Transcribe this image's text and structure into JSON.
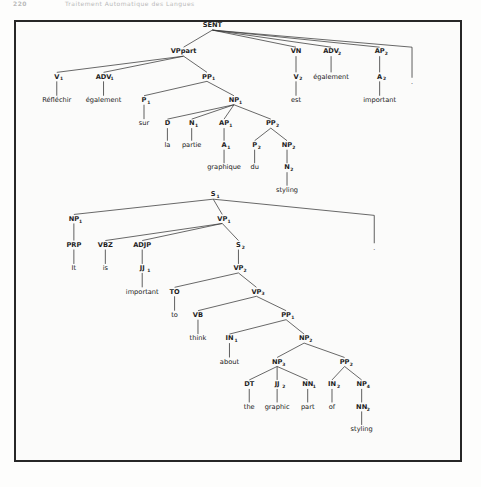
{
  "page": {
    "running_head": {
      "folio": "220",
      "title": "Traitement Automatique des Langues"
    },
    "frame": {
      "border_color": "#272727",
      "background": "#fbfbfa"
    }
  },
  "figure": {
    "trees": [
      {
        "id": "french-tree",
        "root": "SENT",
        "language": "French",
        "nodes": [
          {
            "name": "SENT",
            "label": "SENT",
            "sub": "",
            "x": 228,
            "y": 28,
            "type": "nonterminal"
          },
          {
            "name": "VPpart",
            "label": "VPpart",
            "sub": "",
            "x": 196,
            "y": 57,
            "type": "nonterminal"
          },
          {
            "name": "VN",
            "label": "VN",
            "sub": "",
            "x": 321,
            "y": 57,
            "type": "nonterminal"
          },
          {
            "name": "ADV2",
            "label": "ADV",
            "sub": "2",
            "x": 360,
            "y": 57,
            "type": "nonterminal"
          },
          {
            "name": "AP2",
            "label": "AP",
            "sub": "2",
            "x": 414,
            "y": 57,
            "type": "nonterminal"
          },
          {
            "name": "V1",
            "label": "V",
            "sub": "1",
            "x": 55,
            "y": 85,
            "type": "preterminal"
          },
          {
            "name": "ADV1",
            "label": "ADV",
            "sub": "1",
            "x": 107,
            "y": 85,
            "type": "preterminal"
          },
          {
            "name": "PP1",
            "label": "PP",
            "sub": "1",
            "x": 222,
            "y": 85,
            "type": "nonterminal"
          },
          {
            "name": "V2",
            "label": "V",
            "sub": "2",
            "x": 321,
            "y": 85,
            "type": "preterminal"
          },
          {
            "name": "egalement-adv2",
            "label": "également",
            "sub": "",
            "x": 360,
            "y": 85,
            "type": "leaf"
          },
          {
            "name": "A2",
            "label": "A",
            "sub": "2",
            "x": 414,
            "y": 85,
            "type": "preterminal"
          },
          {
            "name": "Reflechir",
            "label": "Réfléchir",
            "sub": "",
            "x": 55,
            "y": 111,
            "type": "leaf"
          },
          {
            "name": "egalement-adv1",
            "label": "également",
            "sub": "",
            "x": 107,
            "y": 111,
            "type": "leaf"
          },
          {
            "name": "P1",
            "label": "P",
            "sub": "1",
            "x": 152,
            "y": 111,
            "type": "preterminal"
          },
          {
            "name": "NP1",
            "label": "NP",
            "sub": "1",
            "x": 252,
            "y": 111,
            "type": "nonterminal"
          },
          {
            "name": "est",
            "label": "est",
            "sub": "",
            "x": 321,
            "y": 111,
            "type": "leaf"
          },
          {
            "name": "important-a2",
            "label": "important",
            "sub": "",
            "x": 414,
            "y": 111,
            "type": "leaf"
          },
          {
            "name": "sur",
            "label": "sur",
            "sub": "",
            "x": 152,
            "y": 137,
            "type": "leaf"
          },
          {
            "name": "D",
            "label": "D",
            "sub": "",
            "x": 178,
            "y": 137,
            "type": "preterminal"
          },
          {
            "name": "N1",
            "label": "N",
            "sub": "1",
            "x": 205,
            "y": 137,
            "type": "preterminal"
          },
          {
            "name": "AP1",
            "label": "AP",
            "sub": "1",
            "x": 241,
            "y": 137,
            "type": "nonterminal"
          },
          {
            "name": "PP2",
            "label": "PP",
            "sub": "2",
            "x": 293,
            "y": 137,
            "type": "nonterminal"
          },
          {
            "name": "la",
            "label": "la",
            "sub": "",
            "x": 178,
            "y": 161,
            "type": "leaf"
          },
          {
            "name": "partie",
            "label": "partie",
            "sub": "",
            "x": 205,
            "y": 161,
            "type": "leaf"
          },
          {
            "name": "A1",
            "label": "A",
            "sub": "1",
            "x": 241,
            "y": 161,
            "type": "preterminal"
          },
          {
            "name": "P2",
            "label": "P",
            "sub": "2",
            "x": 275,
            "y": 161,
            "type": "preterminal"
          },
          {
            "name": "NP2",
            "label": "NP",
            "sub": "2",
            "x": 311,
            "y": 161,
            "type": "nonterminal"
          },
          {
            "name": "graphique",
            "label": "graphique",
            "sub": "",
            "x": 241,
            "y": 186,
            "type": "leaf"
          },
          {
            "name": "du",
            "label": "du",
            "sub": "",
            "x": 275,
            "y": 186,
            "type": "leaf"
          },
          {
            "name": "N2",
            "label": "N",
            "sub": "2",
            "x": 311,
            "y": 186,
            "type": "preterminal"
          },
          {
            "name": "styling-fr",
            "label": "styling",
            "sub": "",
            "x": 311,
            "y": 211,
            "type": "leaf"
          }
        ],
        "edges": [
          [
            "SENT",
            "VPpart"
          ],
          [
            "SENT",
            "VN"
          ],
          [
            "SENT",
            "ADV2"
          ],
          [
            "SENT",
            "AP2"
          ],
          [
            "VPpart",
            "V1"
          ],
          [
            "VPpart",
            "ADV1"
          ],
          [
            "VPpart",
            "PP1"
          ],
          [
            "VN",
            "V2"
          ],
          [
            "ADV2",
            "egalement-adv2"
          ],
          [
            "AP2",
            "A2"
          ],
          [
            "V1",
            "Reflechir"
          ],
          [
            "ADV1",
            "egalement-adv1"
          ],
          [
            "PP1",
            "P1"
          ],
          [
            "PP1",
            "NP1"
          ],
          [
            "V2",
            "est"
          ],
          [
            "A2",
            "important-a2"
          ],
          [
            "P1",
            "sur"
          ],
          [
            "NP1",
            "D"
          ],
          [
            "NP1",
            "N1"
          ],
          [
            "NP1",
            "AP1"
          ],
          [
            "NP1",
            "PP2"
          ],
          [
            "D",
            "la"
          ],
          [
            "N1",
            "partie"
          ],
          [
            "AP1",
            "A1"
          ],
          [
            "PP2",
            "P2"
          ],
          [
            "PP2",
            "NP2"
          ],
          [
            "A1",
            "graphique"
          ],
          [
            "P2",
            "du"
          ],
          [
            "NP2",
            "N2"
          ],
          [
            "N2",
            "styling-fr"
          ]
        ],
        "final_punct": {
          "name": "sent-final-punct",
          "x": 450,
          "y_top": 50,
          "y_bottom": 84,
          "mark": "."
        },
        "sentence": "Réfléchir également sur la partie graphique du styling est également important ."
      },
      {
        "id": "english-tree",
        "root": "S1",
        "language": "English",
        "nodes": [
          {
            "name": "S1",
            "label": "S",
            "sub": "1",
            "x": 229,
            "y": 216,
            "type": "nonterminal"
          },
          {
            "name": "NP1e",
            "label": "NP",
            "sub": "1",
            "x": 74,
            "y": 243,
            "type": "nonterminal"
          },
          {
            "name": "VP1",
            "label": "VP",
            "sub": "1",
            "x": 239,
            "y": 243,
            "type": "nonterminal"
          },
          {
            "name": "PRP",
            "label": "PRP",
            "sub": "",
            "x": 74,
            "y": 272,
            "type": "preterminal"
          },
          {
            "name": "VBZ",
            "label": "VBZ",
            "sub": "",
            "x": 109,
            "y": 272,
            "type": "preterminal"
          },
          {
            "name": "ADJP",
            "label": "ADJP",
            "sub": "",
            "x": 150,
            "y": 272,
            "type": "nonterminal"
          },
          {
            "name": "S2",
            "label": "S",
            "sub": "2",
            "x": 257,
            "y": 272,
            "type": "nonterminal"
          },
          {
            "name": "It",
            "label": "It",
            "sub": "",
            "x": 74,
            "y": 298,
            "type": "leaf"
          },
          {
            "name": "is",
            "label": "is",
            "sub": "",
            "x": 109,
            "y": 298,
            "type": "leaf"
          },
          {
            "name": "JJ1",
            "label": "JJ",
            "sub": "1",
            "x": 150,
            "y": 298,
            "type": "preterminal"
          },
          {
            "name": "VP2",
            "label": "VP",
            "sub": "2",
            "x": 257,
            "y": 298,
            "type": "nonterminal"
          },
          {
            "name": "important-jj1",
            "label": "important",
            "sub": "",
            "x": 150,
            "y": 324,
            "type": "leaf"
          },
          {
            "name": "TO",
            "label": "TO",
            "sub": "",
            "x": 186,
            "y": 324,
            "type": "preterminal"
          },
          {
            "name": "VP3",
            "label": "VP",
            "sub": "3",
            "x": 277,
            "y": 324,
            "type": "nonterminal"
          },
          {
            "name": "to",
            "label": "to",
            "sub": "",
            "x": 186,
            "y": 350,
            "type": "leaf"
          },
          {
            "name": "VB",
            "label": "VB",
            "sub": "",
            "x": 212,
            "y": 350,
            "type": "preterminal"
          },
          {
            "name": "PP1e",
            "label": "PP",
            "sub": "1",
            "x": 310,
            "y": 350,
            "type": "nonterminal"
          },
          {
            "name": "think",
            "label": "think",
            "sub": "",
            "x": 212,
            "y": 376,
            "type": "leaf"
          },
          {
            "name": "IN1",
            "label": "IN",
            "sub": "1",
            "x": 247,
            "y": 376,
            "type": "preterminal"
          },
          {
            "name": "NP2e",
            "label": "NP",
            "sub": "2",
            "x": 330,
            "y": 376,
            "type": "nonterminal"
          },
          {
            "name": "about",
            "label": "about",
            "sub": "",
            "x": 247,
            "y": 402,
            "type": "leaf"
          },
          {
            "name": "NP3e",
            "label": "NP",
            "sub": "3",
            "x": 300,
            "y": 402,
            "type": "nonterminal"
          },
          {
            "name": "PP2e",
            "label": "PP",
            "sub": "2",
            "x": 375,
            "y": 402,
            "type": "nonterminal"
          },
          {
            "name": "DT",
            "label": "DT",
            "sub": "",
            "x": 269,
            "y": 427,
            "type": "preterminal"
          },
          {
            "name": "JJ2",
            "label": "JJ",
            "sub": "2",
            "x": 300,
            "y": 427,
            "type": "preterminal"
          },
          {
            "name": "NN1",
            "label": "NN",
            "sub": "1",
            "x": 334,
            "y": 427,
            "type": "preterminal"
          },
          {
            "name": "IN2",
            "label": "IN",
            "sub": "2",
            "x": 361,
            "y": 427,
            "type": "preterminal"
          },
          {
            "name": "NP4",
            "label": "NP",
            "sub": "4",
            "x": 394,
            "y": 427,
            "type": "nonterminal"
          },
          {
            "name": "the",
            "label": "the",
            "sub": "",
            "x": 269,
            "y": 452,
            "type": "leaf"
          },
          {
            "name": "graphic",
            "label": "graphic",
            "sub": "",
            "x": 300,
            "y": 452,
            "type": "leaf"
          },
          {
            "name": "part",
            "label": "part",
            "sub": "",
            "x": 334,
            "y": 452,
            "type": "leaf"
          },
          {
            "name": "of",
            "label": "of",
            "sub": "",
            "x": 361,
            "y": 452,
            "type": "leaf"
          },
          {
            "name": "NN2",
            "label": "NN",
            "sub": "2",
            "x": 394,
            "y": 452,
            "type": "preterminal"
          },
          {
            "name": "styling-en",
            "label": "styling",
            "sub": "",
            "x": 394,
            "y": 477,
            "type": "leaf"
          }
        ],
        "edges": [
          [
            "S1",
            "NP1e"
          ],
          [
            "S1",
            "VP1"
          ],
          [
            "NP1e",
            "PRP"
          ],
          [
            "PRP",
            "It"
          ],
          [
            "VP1",
            "VBZ"
          ],
          [
            "VP1",
            "ADJP"
          ],
          [
            "VP1",
            "S2"
          ],
          [
            "VBZ",
            "is"
          ],
          [
            "ADJP",
            "JJ1"
          ],
          [
            "JJ1",
            "important-jj1"
          ],
          [
            "S2",
            "VP2"
          ],
          [
            "VP2",
            "TO"
          ],
          [
            "VP2",
            "VP3"
          ],
          [
            "TO",
            "to"
          ],
          [
            "VP3",
            "VB"
          ],
          [
            "VP3",
            "PP1e"
          ],
          [
            "VB",
            "think"
          ],
          [
            "PP1e",
            "IN1"
          ],
          [
            "PP1e",
            "NP2e"
          ],
          [
            "IN1",
            "about"
          ],
          [
            "NP2e",
            "NP3e"
          ],
          [
            "NP2e",
            "PP2e"
          ],
          [
            "NP3e",
            "DT"
          ],
          [
            "NP3e",
            "JJ2"
          ],
          [
            "NP3e",
            "NN1"
          ],
          [
            "PP2e",
            "IN2"
          ],
          [
            "PP2e",
            "NP4"
          ],
          [
            "DT",
            "the"
          ],
          [
            "JJ2",
            "graphic"
          ],
          [
            "NN1",
            "part"
          ],
          [
            "IN2",
            "of"
          ],
          [
            "NP4",
            "NN2"
          ],
          [
            "NN2",
            "styling-en"
          ]
        ],
        "final_punct": {
          "name": "s1-final-punct",
          "x": 408,
          "y_top": 237,
          "y_bottom": 268,
          "mark": "."
        },
        "sentence": "It is important to think about the graphic part of styling ."
      }
    ]
  }
}
